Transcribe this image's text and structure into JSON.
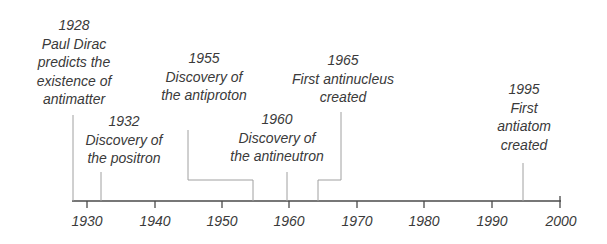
{
  "diagram": {
    "type": "timeline",
    "axis": {
      "start_year": 1928,
      "end_year": 2000,
      "tick_years": [
        1930,
        1940,
        1950,
        1960,
        1970,
        1980,
        1990,
        2000
      ],
      "tick_labels": [
        "1930",
        "1940",
        "1950",
        "1960",
        "1970",
        "1980",
        "1990",
        "2000"
      ]
    },
    "events": [
      {
        "year": "1928",
        "lines": [
          "Paul Dirac",
          "predicts the",
          "existence of",
          "antimatter"
        ]
      },
      {
        "year": "1932",
        "lines": [
          "Discovery of",
          "the positron"
        ]
      },
      {
        "year": "1955",
        "lines": [
          "Discovery of",
          "the antiproton"
        ]
      },
      {
        "year": "1960",
        "lines": [
          "Discovery of",
          "the antineutron"
        ]
      },
      {
        "year": "1965",
        "lines": [
          "First antinucleus",
          "created"
        ]
      },
      {
        "year": "1995",
        "lines": [
          "First",
          "antiatom",
          "created"
        ]
      }
    ],
    "colors": {
      "text": "#3a3a3a",
      "axis": "#4a4a4a",
      "connector": "#a0a0a0"
    }
  }
}
